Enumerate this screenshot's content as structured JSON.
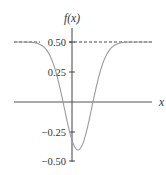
{
  "chart_data": {
    "type": "line",
    "title": "",
    "xlabel": "x",
    "ylabel": "f(x)",
    "ylim": [
      -0.5,
      0.5
    ],
    "yticks": [
      0.5,
      0.25,
      -0.25,
      -0.5
    ],
    "ytick_labels": [
      "0.50",
      "0.25",
      "−0.25",
      "−0.50"
    ],
    "grid": false,
    "legend": null,
    "series": [
      {
        "name": "f(x)",
        "description": "Gaussian-shaped dip approaching asymptote 0.5 on both sides",
        "x": [
          -3,
          -2,
          -1.5,
          -1,
          -0.5,
          0,
          0.5,
          1,
          1.5,
          2,
          3
        ],
        "values": [
          0.5,
          0.47,
          0.4,
          0.18,
          -0.2,
          -0.4,
          -0.2,
          0.18,
          0.4,
          0.47,
          0.5
        ],
        "minimum": {
          "x": 0,
          "y": -0.4
        },
        "color": "#9a9a9a"
      },
      {
        "name": "asymptote",
        "style": "dashed",
        "y": 0.5,
        "color": "#333333"
      }
    ],
    "annotations": []
  },
  "colors": {
    "axis": "#333333",
    "curve": "#9a9a9a",
    "asymptote": "#333333"
  }
}
